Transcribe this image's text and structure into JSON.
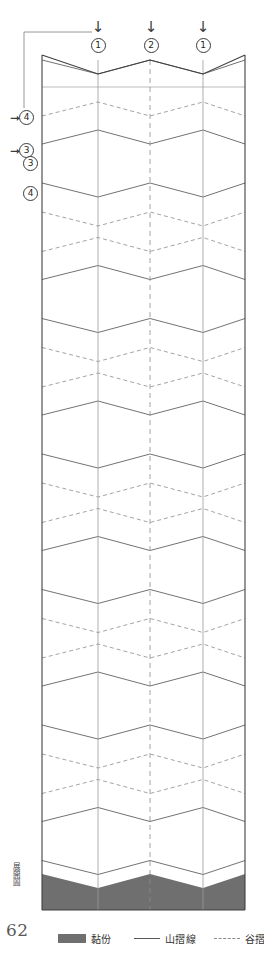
{
  "page": {
    "number": "62",
    "side_caption": "展開圖",
    "background": "#ffffff"
  },
  "colors": {
    "glue_fill": "#706f6f",
    "mountain_line": "#58595b",
    "valley_line": "#8b8b8b",
    "outline": "#404040",
    "ink": "#231f20"
  },
  "legend": {
    "items": [
      {
        "key": "glue",
        "swatch": "solid-block",
        "label": "黏份"
      },
      {
        "key": "mountain",
        "swatch": "solid-line",
        "label": "山摺線"
      },
      {
        "key": "valley",
        "swatch": "dashed-line",
        "label": "谷摺線"
      }
    ]
  },
  "top_callouts": [
    {
      "arrow": "↓",
      "number": "1",
      "x": 89
    },
    {
      "arrow": "↓",
      "number": "2",
      "x": 142
    },
    {
      "arrow": "↓",
      "number": "1",
      "x": 194
    }
  ],
  "left_callouts": [
    {
      "number": "4",
      "arrow": "➞",
      "has_arrow": true,
      "y": 110
    },
    {
      "number": "3",
      "arrow": "➞",
      "has_arrow": true,
      "y": 143
    },
    {
      "number": "3",
      "arrow": "",
      "has_arrow": false,
      "y": 156
    },
    {
      "number": "4",
      "arrow": "",
      "has_arrow": false,
      "y": 186
    }
  ],
  "chart_data": {
    "type": "diagram",
    "title": "展開圖",
    "panel": {
      "left": 42,
      "right": 245,
      "top": 55,
      "bottom": 910
    },
    "vertical_fold_x": [
      42,
      98,
      150,
      203,
      245
    ],
    "vertical_fold_styles": [
      "solid",
      "solid",
      "dashed",
      "solid",
      "solid"
    ],
    "zigzag_period": 135.5,
    "zigzag_start_y": 116,
    "repeat_count": 6,
    "band_offsets": {
      "valley_upper": 0,
      "mountain_upper": 28,
      "mountain_lower": 67,
      "valley_lower": 96
    },
    "peak_amplitude": 14,
    "header_band": {
      "ridge_y": 60,
      "peak_y": 74,
      "rule_y": 87
    },
    "glue_tab": {
      "top_mid_y": 888,
      "top_peak_y": 874,
      "bottom_y": 910
    }
  }
}
